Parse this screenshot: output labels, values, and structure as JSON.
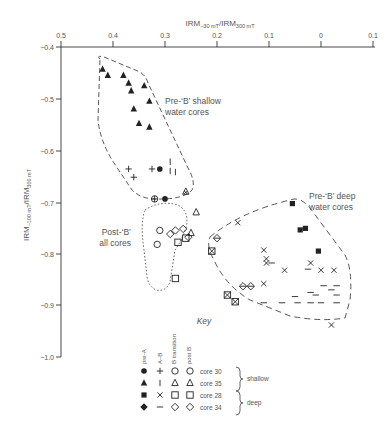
{
  "chart_data": {
    "type": "scatter",
    "title": "",
    "xlabel": "IRM-30mT/IRM300mT",
    "xlabel_main": "IRM",
    "xlabel_sub1": "−30 mT",
    "xlabel_mid": "/IRM",
    "xlabel_sub2": "300 mT",
    "ylabel": "IRM-100mT/IRM300mT",
    "ylabel_main": "IRM",
    "ylabel_sub1": "−100 mT",
    "ylabel_mid": "/IRM",
    "ylabel_sub2": "300 mT",
    "x_axis_position": "top",
    "x_reversed": true,
    "xlim": [
      0.5,
      -0.1
    ],
    "ylim": [
      -1.0,
      -0.4
    ],
    "x_ticks": [
      0.5,
      0.4,
      0.3,
      0.2,
      0.1,
      0,
      -0.1
    ],
    "x_tick_labels": [
      "0.5",
      "0.4",
      "0.3",
      "0.2",
      "0.1",
      "0",
      "0.1"
    ],
    "y_ticks": [
      -0.4,
      -0.5,
      -0.6,
      -0.7,
      -0.8,
      -0.9,
      -1.0
    ],
    "y_tick_labels": [
      "−0.4",
      "−0.5",
      "−0.6",
      "−0.7",
      "−0.8",
      "−0.9",
      "−1.0"
    ],
    "grid": false,
    "legend_position": "bottom-center",
    "annotations": [
      {
        "text": "Pre-‘B’ shallow",
        "x": 0.27,
        "y": -0.562
      },
      {
        "text": "water cores",
        "x": 0.27,
        "y": -0.583
      },
      {
        "text": "Pre-‘B’ deep",
        "x": 0.09,
        "y": -0.735
      },
      {
        "text": "water cores",
        "x": 0.09,
        "y": -0.755
      },
      {
        "text": "Post-‘B’",
        "x": 0.345,
        "y": -0.785
      },
      {
        "text": "all cores",
        "x": 0.345,
        "y": -0.805
      },
      {
        "text": "Key",
        "x": 0.2,
        "y": -0.905
      }
    ],
    "series": [
      {
        "name": "core 35 pre-A",
        "marker": "triangle-filled",
        "points": [
          [
            0.42,
            -0.443
          ],
          [
            0.41,
            -0.455
          ],
          [
            0.38,
            -0.455
          ],
          [
            0.37,
            -0.47
          ],
          [
            0.34,
            -0.475
          ],
          [
            0.365,
            -0.485
          ],
          [
            0.33,
            -0.505
          ],
          [
            0.36,
            -0.52
          ],
          [
            0.35,
            -0.548
          ],
          [
            0.33,
            -0.555
          ]
        ]
      },
      {
        "name": "core 30 pre-A",
        "marker": "circle-filled",
        "points": [
          [
            0.31,
            -0.636
          ],
          [
            0.3,
            -0.694
          ]
        ]
      },
      {
        "name": "core 30 A-B",
        "marker": "plus",
        "points": [
          [
            0.37,
            -0.636
          ],
          [
            0.325,
            -0.636
          ],
          [
            0.36,
            -0.652
          ]
        ]
      },
      {
        "name": "core 35 A-B",
        "marker": "vbar",
        "points": [
          [
            0.29,
            -0.622
          ],
          [
            0.29,
            -0.64
          ],
          [
            0.28,
            -0.642
          ]
        ]
      },
      {
        "name": "core 30 B-transition",
        "marker": "circle-plus",
        "points": [
          [
            0.32,
            -0.694
          ]
        ]
      },
      {
        "name": "core 35 B-transition",
        "marker": "triangle-cross",
        "points": [
          [
            0.26,
            -0.68
          ]
        ]
      },
      {
        "name": "core 28 pre-A",
        "marker": "square-filled",
        "points": [
          [
            0.055,
            -0.703
          ],
          [
            0.04,
            -0.754
          ],
          [
            0.03,
            -0.751
          ],
          [
            0.005,
            -0.795
          ]
        ]
      },
      {
        "name": "core 28 A-B",
        "marker": "x",
        "points": [
          [
            0.16,
            -0.74
          ],
          [
            0.11,
            -0.793
          ],
          [
            0.105,
            -0.81
          ],
          [
            0.105,
            -0.818
          ],
          [
            0.07,
            -0.832
          ],
          [
            0.02,
            -0.818
          ],
          [
            0.0,
            -0.832
          ],
          [
            -0.025,
            -0.832
          ],
          [
            0.11,
            -0.858
          ],
          [
            -0.02,
            -0.938
          ]
        ]
      },
      {
        "name": "core 34 A-B",
        "marker": "dash",
        "points": [
          [
            0.095,
            -0.818
          ],
          [
            0.025,
            -0.83
          ],
          [
            -0.005,
            -0.862
          ],
          [
            -0.03,
            -0.862
          ],
          [
            -0.02,
            -0.87
          ],
          [
            0.01,
            -0.88
          ],
          [
            0.11,
            -0.895
          ],
          [
            0.075,
            -0.895
          ],
          [
            0.045,
            -0.895
          ],
          [
            0.02,
            -0.895
          ],
          [
            0.0,
            -0.895
          ],
          [
            -0.03,
            -0.895
          ],
          [
            -0.03,
            -0.88
          ],
          [
            0.05,
            -0.883
          ],
          [
            0.02,
            -0.875
          ]
        ]
      },
      {
        "name": "core 28 B-transition",
        "marker": "square-cross",
        "points": [
          [
            0.21,
            -0.795
          ],
          [
            0.18,
            -0.88
          ],
          [
            0.165,
            -0.893
          ]
        ]
      },
      {
        "name": "core 34 B-transition",
        "marker": "diamond-cross",
        "points": [
          [
            0.15,
            -0.863
          ],
          [
            0.135,
            -0.863
          ],
          [
            0.2,
            -0.77
          ]
        ]
      },
      {
        "name": "core 30 post-B",
        "marker": "circle-open",
        "points": [
          [
            0.31,
            -0.755
          ],
          [
            0.315,
            -0.782
          ]
        ]
      },
      {
        "name": "core 35 post-B",
        "marker": "triangle-open",
        "points": [
          [
            0.24,
            -0.72
          ],
          [
            0.25,
            -0.76
          ]
        ]
      },
      {
        "name": "core 28 post-B",
        "marker": "square-open",
        "points": [
          [
            0.275,
            -0.778
          ],
          [
            0.26,
            -0.77
          ],
          [
            0.28,
            -0.848
          ]
        ]
      },
      {
        "name": "core 34 post-B",
        "marker": "diamond-open",
        "points": [
          [
            0.29,
            -0.762
          ],
          [
            0.28,
            -0.755
          ],
          [
            0.265,
            -0.752
          ],
          [
            0.255,
            -0.768
          ]
        ]
      }
    ],
    "regions": [
      {
        "name": "Pre-B shallow water cores",
        "style": "dashed"
      },
      {
        "name": "Post-B all cores",
        "style": "dotted"
      },
      {
        "name": "Pre-B deep water cores",
        "style": "dashed"
      }
    ]
  },
  "key": {
    "title": "Key",
    "column_headers": [
      "pre-A",
      "A–B",
      "B transition",
      "post B"
    ],
    "rows": [
      {
        "label": "core 30",
        "symbols": [
          "circle-filled",
          "plus",
          "circle-open",
          "circle-open"
        ]
      },
      {
        "label": "core 35",
        "symbols": [
          "triangle-filled",
          "vbar",
          "triangle-open",
          "triangle-open"
        ]
      },
      {
        "label": "core 28",
        "symbols": [
          "square-filled",
          "x",
          "square-open",
          "square-open"
        ]
      },
      {
        "label": "core 34",
        "symbols": [
          "diamond-filled",
          "dash",
          "diamond-open",
          "diamond-open"
        ]
      }
    ],
    "groups": [
      {
        "label": "shallow",
        "rows": [
          "core 30",
          "core 35"
        ]
      },
      {
        "label": "deep",
        "rows": [
          "core 28",
          "core 34"
        ]
      }
    ]
  },
  "colors": {
    "ink": "#222222",
    "text": "#555555",
    "accent_dash": "#c0392b"
  }
}
